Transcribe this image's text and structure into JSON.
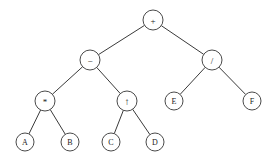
{
  "figure": {
    "kind": "binary-expression-tree",
    "background_color": "#ffffff",
    "node_fill": "#ffffff",
    "node_stroke": "#4a4a4a",
    "edge_color": "#3a3a3a",
    "label_color": "#1a1a1a",
    "node_radius": 10,
    "leaf_radius": 9
  },
  "nodes": [
    {
      "id": "n0",
      "label": "+",
      "kind": "operator",
      "cx": 153,
      "cy": 20,
      "r": 10,
      "level": 0
    },
    {
      "id": "n1",
      "label": "−",
      "kind": "operator",
      "cx": 90,
      "cy": 60,
      "r": 10,
      "level": 1
    },
    {
      "id": "n2",
      "label": "/",
      "kind": "operator",
      "cx": 212,
      "cy": 60,
      "r": 10,
      "level": 1
    },
    {
      "id": "n3",
      "label": "*",
      "kind": "operator",
      "cx": 45,
      "cy": 101,
      "r": 10,
      "level": 2
    },
    {
      "id": "n4",
      "label": "↑",
      "kind": "operator",
      "cx": 127,
      "cy": 101,
      "r": 10,
      "level": 2
    },
    {
      "id": "n5",
      "label": "E",
      "kind": "operand",
      "cx": 174,
      "cy": 101,
      "r": 9,
      "level": 2
    },
    {
      "id": "n6",
      "label": "F",
      "kind": "operand",
      "cx": 252,
      "cy": 101,
      "r": 9,
      "level": 2
    },
    {
      "id": "n7",
      "label": "A",
      "kind": "operand",
      "cx": 25,
      "cy": 142,
      "r": 9,
      "level": 3
    },
    {
      "id": "n8",
      "label": "B",
      "kind": "operand",
      "cx": 70,
      "cy": 142,
      "r": 9,
      "level": 3
    },
    {
      "id": "n9",
      "label": "C",
      "kind": "operand",
      "cx": 111,
      "cy": 142,
      "r": 9,
      "level": 3
    },
    {
      "id": "n10",
      "label": "D",
      "kind": "operand",
      "cx": 155,
      "cy": 142,
      "r": 9,
      "level": 3
    }
  ],
  "edges": [
    {
      "from": "n0",
      "to": "n1"
    },
    {
      "from": "n0",
      "to": "n2"
    },
    {
      "from": "n1",
      "to": "n3"
    },
    {
      "from": "n1",
      "to": "n4"
    },
    {
      "from": "n2",
      "to": "n5"
    },
    {
      "from": "n2",
      "to": "n6"
    },
    {
      "from": "n3",
      "to": "n7"
    },
    {
      "from": "n3",
      "to": "n8"
    },
    {
      "from": "n4",
      "to": "n9"
    },
    {
      "from": "n4",
      "to": "n10"
    }
  ]
}
